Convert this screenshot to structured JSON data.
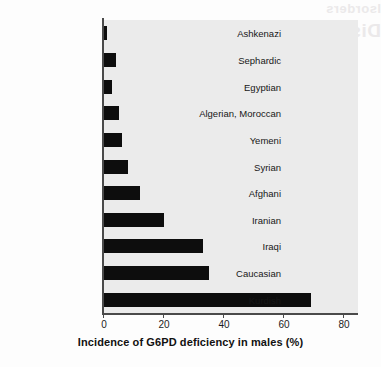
{
  "background": {
    "page_color": "#fdfdfd",
    "plot_color": "#ebebeb",
    "bar_color": "#0d0d0d",
    "axis_color": "#4a4a4a",
    "bleed_line_1": "Isorders",
    "bleed_line_2": "Disorders"
  },
  "chart_data": {
    "type": "bar",
    "orientation": "horizontal",
    "title": "",
    "subtitle": "",
    "xlabel": "Incidence of G6PD deficiency in males (%)",
    "ylabel": "",
    "xlim": [
      0,
      85
    ],
    "ylim": [],
    "xticks": [
      0,
      20,
      40,
      60,
      80
    ],
    "xtick_labels": [
      "0",
      "20",
      "40",
      "60",
      "80"
    ],
    "grid": false,
    "legend": false,
    "legend_position": "none",
    "categories": [
      "Ashkenazi",
      "Sephardic",
      "Egyptian",
      "Algerian, Moroccan",
      "Yemeni",
      "Syrian",
      "Afghani",
      "Iranian",
      "Iraqi",
      "Caucasian",
      "Kurdish"
    ],
    "values": [
      1,
      4,
      2.5,
      5,
      6,
      8,
      12,
      20,
      33,
      35,
      69
    ],
    "annotations": []
  }
}
